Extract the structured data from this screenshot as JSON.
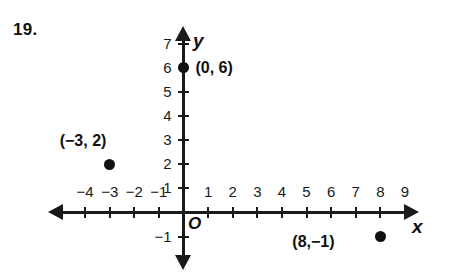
{
  "problem": {
    "number": "19."
  },
  "chart_data": {
    "type": "scatter",
    "title": "",
    "xlabel": "x",
    "ylabel": "y",
    "xlim": [
      -4.8,
      9.6
    ],
    "ylim": [
      -1.8,
      7.6
    ],
    "grid": false,
    "legend": "none",
    "origin_label": "O",
    "x_ticks": [
      -4,
      -3,
      -2,
      -1,
      1,
      2,
      3,
      4,
      5,
      6,
      7,
      8,
      9
    ],
    "x_tick_labels": [
      "−4",
      "−3",
      "−2",
      "−1",
      "1",
      "2",
      "3",
      "4",
      "5",
      "6",
      "7",
      "8",
      "9"
    ],
    "y_ticks": [
      -1,
      1,
      2,
      3,
      4,
      5,
      6,
      7
    ],
    "y_tick_labels": [
      "−1",
      "1",
      "2",
      "3",
      "4",
      "5",
      "6",
      "7"
    ],
    "points": [
      {
        "x": 0,
        "y": 6,
        "label": "(0, 6)"
      },
      {
        "x": -3,
        "y": 2,
        "label": "(−3, 2)"
      },
      {
        "x": 8,
        "y": -1,
        "label": "(8,−1)"
      }
    ],
    "colors": {
      "axis": "#1a1a1a",
      "point": "#111111",
      "background": "#ffffff"
    }
  }
}
